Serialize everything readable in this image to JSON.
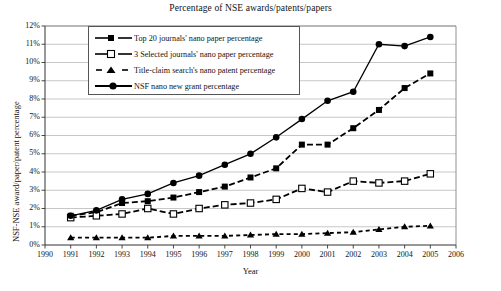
{
  "chart_data": {
    "type": "line",
    "title": "Percentage of NSE awards/patents/papers",
    "xlabel": "Year",
    "ylabel": "NSF-NSE award/paper/patent percentage",
    "xlim": [
      1990,
      2006
    ],
    "ylim": [
      0,
      12
    ],
    "grid": true,
    "legend_position": "upper-left-inside",
    "x": [
      1991,
      1992,
      1993,
      1994,
      1995,
      1996,
      1997,
      1998,
      1999,
      2000,
      2001,
      2002,
      2003,
      2004,
      2005
    ],
    "xticks": [
      "1990",
      "1991",
      "1992",
      "1993",
      "1994",
      "1995",
      "1996",
      "1997",
      "1998",
      "1999",
      "2000",
      "2001",
      "2002",
      "2003",
      "2004",
      "2005",
      "2006"
    ],
    "yticks": [
      "0%",
      "1%",
      "2%",
      "3%",
      "4%",
      "5%",
      "6%",
      "7%",
      "8%",
      "9%",
      "10%",
      "11%",
      "12%"
    ],
    "series": [
      {
        "name": "Top 20 journals' nano paper percentage",
        "marker": "filled-square",
        "line": "dashed",
        "color": "#000000",
        "values": [
          1.6,
          1.8,
          2.3,
          2.4,
          2.6,
          2.9,
          3.2,
          3.7,
          4.2,
          5.5,
          5.5,
          6.4,
          7.4,
          8.6,
          9.4
        ]
      },
      {
        "name": "3 Selected journals' nano paper percentage",
        "marker": "open-square",
        "line": "dashed",
        "color": "#000000",
        "values": [
          1.5,
          1.6,
          1.7,
          2.0,
          1.7,
          2.0,
          2.2,
          2.3,
          2.5,
          3.1,
          2.9,
          3.5,
          3.4,
          3.5,
          3.9
        ]
      },
      {
        "name": "Title-claim  search's nano patent percentage",
        "marker": "triangle",
        "line": "dashed",
        "color": "#000000",
        "values": [
          0.4,
          0.4,
          0.4,
          0.4,
          0.5,
          0.5,
          0.5,
          0.55,
          0.6,
          0.6,
          0.65,
          0.7,
          0.85,
          1.0,
          1.05
        ]
      },
      {
        "name": "NSF nano new  grant percentage",
        "marker": "filled-circle",
        "line": "solid",
        "color": "#000000",
        "values": [
          1.6,
          1.9,
          2.5,
          2.8,
          3.4,
          3.8,
          4.4,
          5.0,
          5.9,
          6.9,
          7.9,
          8.4,
          11.0,
          10.9,
          11.4
        ]
      }
    ]
  }
}
